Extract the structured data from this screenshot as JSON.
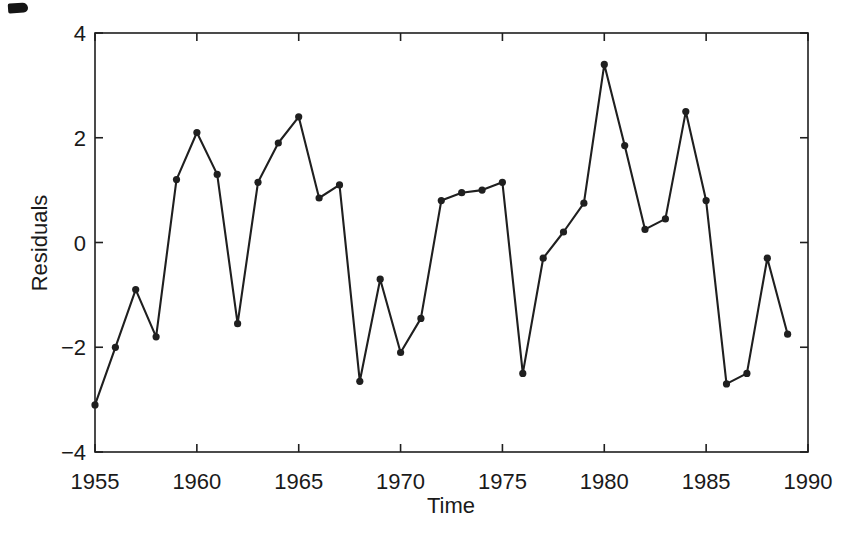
{
  "figure": {
    "background": "#ffffff",
    "ink_color": "#1f1f1f"
  },
  "chart_data": {
    "type": "line",
    "title": "",
    "xlabel": "Time",
    "ylabel": "Residuals",
    "xlim": [
      1955,
      1990
    ],
    "ylim": [
      -4,
      4
    ],
    "xticks": [
      1955,
      1960,
      1965,
      1970,
      1975,
      1980,
      1985,
      1990
    ],
    "xtick_labels": [
      "1955",
      "1960",
      "1965",
      "1970",
      "1975",
      "1980",
      "1985",
      "1990"
    ],
    "yticks": [
      4,
      2,
      0,
      -2,
      -4
    ],
    "ytick_labels": [
      "4",
      "2",
      "0",
      "−2",
      "−4"
    ],
    "grid": false,
    "legend": "none",
    "box": true,
    "tick_direction": "in",
    "marker": "filled-circle",
    "line_color": "#1f1f1f",
    "marker_color": "#1f1f1f",
    "x": [
      1955,
      1956,
      1957,
      1958,
      1959,
      1960,
      1961,
      1962,
      1963,
      1964,
      1965,
      1966,
      1967,
      1968,
      1969,
      1970,
      1971,
      1972,
      1973,
      1974,
      1975,
      1976,
      1977,
      1978,
      1979,
      1980,
      1981,
      1982,
      1983,
      1984,
      1985,
      1986,
      1987,
      1988,
      1989
    ],
    "y": [
      -3.1,
      -2.0,
      -0.9,
      -1.8,
      1.2,
      2.1,
      1.3,
      -1.55,
      1.15,
      1.9,
      2.4,
      0.85,
      1.1,
      -2.65,
      -0.7,
      -2.1,
      -1.45,
      0.8,
      0.95,
      1.0,
      1.15,
      -2.5,
      -0.3,
      0.2,
      0.75,
      3.4,
      1.85,
      0.25,
      0.45,
      2.5,
      0.8,
      -2.7,
      -2.5,
      -0.3,
      -1.75
    ]
  }
}
